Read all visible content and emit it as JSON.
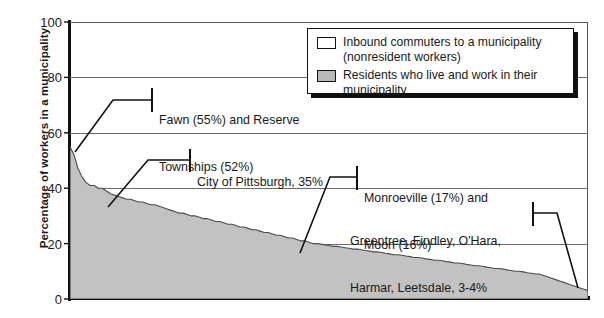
{
  "chart_data": {
    "type": "area",
    "title": "",
    "xlabel": "",
    "ylabel": "Percentage of workers in a municipality",
    "ylim": [
      0,
      100
    ],
    "yticks": [
      0,
      20,
      40,
      60,
      80,
      100
    ],
    "ytick_labels": [
      "0",
      "20",
      "40",
      "60",
      "80",
      "100"
    ],
    "grid": true,
    "grid_axis": "y",
    "legend_position": "top-right",
    "series": [
      {
        "name": "Residents who live and work in their municipality",
        "fill": "#c2c2c2",
        "values": [
          55,
          52,
          47,
          44,
          42,
          41,
          41,
          40,
          40,
          39,
          38,
          37.5,
          37,
          36.5,
          36,
          36,
          35.5,
          35,
          35,
          34.5,
          34,
          34,
          33.5,
          33,
          32.5,
          32,
          31.5,
          31,
          31,
          30.5,
          30,
          30,
          29.5,
          29,
          29,
          28.5,
          28,
          28,
          27.5,
          27,
          27,
          26.5,
          26,
          26,
          25.5,
          25,
          25,
          24.5,
          24,
          24,
          23.5,
          23,
          23,
          22.5,
          22,
          22,
          21.5,
          21,
          21,
          20.5,
          20,
          20,
          19.8,
          19.5,
          19.3,
          19,
          19,
          18.8,
          18.5,
          18.3,
          18,
          18,
          17.8,
          17.5,
          17.3,
          17,
          17,
          16.8,
          16.5,
          16.3,
          16,
          16,
          15.8,
          15.5,
          15.3,
          15,
          15,
          14.8,
          14.5,
          14.3,
          14,
          14,
          13.8,
          13.5,
          13.3,
          13,
          13,
          12.8,
          12.5,
          12.3,
          12,
          12,
          11.8,
          11.5,
          11.3,
          11,
          11,
          10.8,
          10.5,
          10.3,
          10,
          10,
          9.8,
          9.5,
          9.3,
          9,
          9,
          8.5,
          8,
          7.5,
          7,
          6.5,
          6,
          5.5,
          5,
          4.5,
          4,
          3.5,
          3
        ]
      },
      {
        "name": "Inbound commuters to a municipality (nonresident workers)",
        "fill": "#ffffff"
      }
    ]
  },
  "axis": {
    "ylabel": "Percentage of workers in a municipality",
    "yticks": [
      "100",
      "80",
      "60",
      "40",
      "20",
      "0"
    ]
  },
  "legend": {
    "items": [
      {
        "swatch": "white",
        "line1": "Inbound commuters to a municipality",
        "line2": "(nonresident workers)"
      },
      {
        "swatch": "gray",
        "line1": "Residents who live and work in their",
        "line2": "municipality"
      }
    ]
  },
  "annotations": [
    {
      "id": "fawn",
      "line1": "Fawn (55%) and Reserve",
      "line2": "Townships (52%)"
    },
    {
      "id": "pittsburgh",
      "line1": "City of Pittsburgh, 35%",
      "line2": ""
    },
    {
      "id": "monroeville",
      "line1": "Monroeville (17%) and",
      "line2": "Moon (16%)"
    },
    {
      "id": "greentree",
      "line1": "Greentree, Findley, O'Hara,",
      "line2": "Harmar, Leetsdale, 3-4%"
    }
  ],
  "colors": {
    "area_fill": "#c2c2c2",
    "area_stroke": "#4a4a4a",
    "axis": "#111111",
    "grid": "#6b6b6b",
    "background": "#ffffff"
  }
}
